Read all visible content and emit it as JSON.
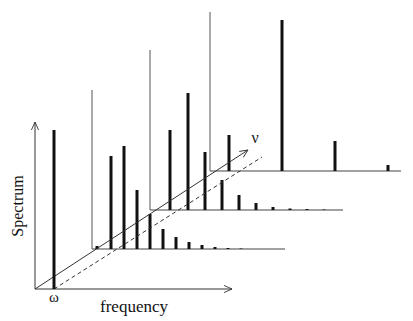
{
  "labels": {
    "y_axis": "Spectrum",
    "x_axis": "frequency",
    "omega": "ω",
    "nu": "ν"
  },
  "colors": {
    "background": "#ffffff",
    "ink": "#111111"
  },
  "geometry": {
    "origin": [
      35,
      289
    ],
    "y_axis_top": [
      35,
      122
    ],
    "x_axis_end": [
      232,
      289
    ],
    "nu_axis_end": [
      248,
      150
    ],
    "omega_bar": {
      "x": 54,
      "top": 130,
      "bottom": 289
    },
    "dashed_start": [
      54,
      289
    ],
    "dashed_end": [
      262,
      157
    ]
  },
  "planes": [
    {
      "name": "plane-1",
      "baseline_y": 249,
      "x_start": 92,
      "x_end": 285,
      "backline_top": 90,
      "bars": [
        {
          "x": 97,
          "top": 246
        },
        {
          "x": 111,
          "top": 156
        },
        {
          "x": 124,
          "top": 146
        },
        {
          "x": 137,
          "top": 190
        },
        {
          "x": 150,
          "top": 214
        },
        {
          "x": 163,
          "top": 229
        },
        {
          "x": 176,
          "top": 237
        },
        {
          "x": 189,
          "top": 242
        },
        {
          "x": 202,
          "top": 245
        },
        {
          "x": 215,
          "top": 247
        },
        {
          "x": 228,
          "top": 248
        },
        {
          "x": 241,
          "top": 248.5
        }
      ]
    },
    {
      "name": "plane-2",
      "baseline_y": 210,
      "x_start": 150,
      "x_end": 343,
      "backline_top": 50,
      "bars": [
        {
          "x": 170,
          "top": 130
        },
        {
          "x": 188,
          "top": 93
        },
        {
          "x": 205,
          "top": 152
        },
        {
          "x": 222,
          "top": 180
        },
        {
          "x": 239,
          "top": 195
        },
        {
          "x": 256,
          "top": 203
        },
        {
          "x": 273,
          "top": 207
        },
        {
          "x": 290,
          "top": 208.5
        },
        {
          "x": 307,
          "top": 209
        },
        {
          "x": 324,
          "top": 209.5
        }
      ]
    },
    {
      "name": "plane-3",
      "baseline_y": 171,
      "x_start": 210,
      "x_end": 401,
      "backline_top": 12,
      "bars": [
        {
          "x": 229,
          "top": 135
        },
        {
          "x": 282,
          "top": 20
        },
        {
          "x": 335,
          "top": 141
        },
        {
          "x": 388,
          "top": 165
        }
      ]
    }
  ]
}
